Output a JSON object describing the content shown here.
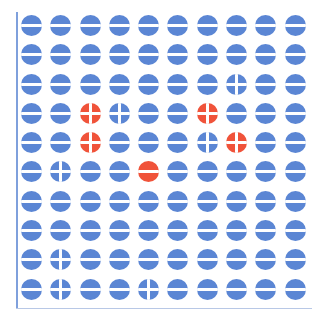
{
  "figure": {
    "rows": 10,
    "columns": 10,
    "colors": {
      "blue": "#5b86d4",
      "red": "#f0533a",
      "axis": "#7fa0dc"
    },
    "cells": [
      [
        "blue-halved",
        "blue-halved",
        "blue-halved",
        "blue-halved",
        "blue-halved",
        "blue-halved",
        "blue-halved",
        "blue-halved",
        "blue-halved",
        "blue-halved"
      ],
      [
        "blue-halved",
        "blue-halved",
        "blue-halved",
        "blue-halved",
        "blue-halved",
        "blue-halved",
        "blue-halved",
        "blue-halved",
        "blue-halved",
        "blue-halved"
      ],
      [
        "blue-halved",
        "blue-halved",
        "blue-halved",
        "blue-halved",
        "blue-halved",
        "blue-halved",
        "blue-halved",
        "blue-quartered",
        "blue-halved",
        "blue-halved"
      ],
      [
        "blue-halved",
        "blue-halved",
        "red-quartered",
        "blue-quartered",
        "blue-halved",
        "blue-halved",
        "red-quartered",
        "blue-halved",
        "blue-halved",
        "blue-halved"
      ],
      [
        "blue-halved",
        "blue-halved",
        "red-quartered",
        "blue-halved",
        "blue-halved",
        "blue-halved",
        "blue-quartered",
        "red-quartered",
        "blue-halved",
        "blue-halved"
      ],
      [
        "blue-halved",
        "blue-quartered",
        "blue-halved",
        "blue-halved",
        "red-halved",
        "blue-halved",
        "blue-halved",
        "blue-halved",
        "blue-halved",
        "blue-halved"
      ],
      [
        "blue-halved",
        "blue-halved",
        "blue-halved",
        "blue-halved",
        "blue-halved",
        "blue-halved",
        "blue-halved",
        "blue-halved",
        "blue-halved",
        "blue-halved"
      ],
      [
        "blue-halved",
        "blue-halved",
        "blue-halved",
        "blue-halved",
        "blue-halved",
        "blue-halved",
        "blue-halved",
        "blue-halved",
        "blue-halved",
        "blue-halved"
      ],
      [
        "blue-halved",
        "blue-quartered",
        "blue-halved",
        "blue-halved",
        "blue-halved",
        "blue-halved",
        "blue-halved",
        "blue-halved",
        "blue-halved",
        "blue-halved"
      ],
      [
        "blue-halved",
        "blue-quartered",
        "blue-halved",
        "blue-halved",
        "blue-quartered",
        "blue-halved",
        "blue-halved",
        "blue-halved",
        "blue-halved",
        "blue-halved"
      ]
    ],
    "counts": {
      "blue-halved": 88,
      "blue-quartered": 7,
      "red-quartered": 4,
      "red-halved": 1
    }
  }
}
